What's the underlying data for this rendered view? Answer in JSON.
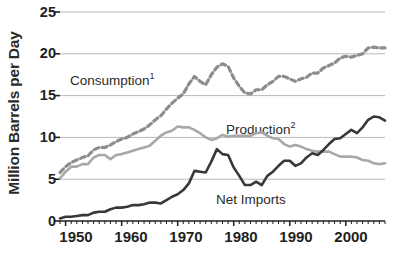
{
  "axes": {
    "y_title": "Million Barrels per Day",
    "y_ticks": [
      "25",
      "20",
      "15",
      "10",
      "5",
      "0"
    ],
    "x_ticks": [
      "1950",
      "1960",
      "1970",
      "1980",
      "1990",
      "2000"
    ]
  },
  "labels": {
    "consumption": "Consumption",
    "consumption_sup": "1",
    "production": "Production",
    "production_sup": "2",
    "net_imports": "Net Imports"
  },
  "colors": {
    "consumption": "#8d8d8d",
    "production": "#a8a8a8",
    "net_imports": "#383838",
    "grid": "#b9b9b9",
    "axis": "#1f1f1f",
    "text": "#1f1f1f"
  },
  "chart_data": {
    "type": "line",
    "title": "",
    "xlabel": "",
    "ylabel": "Million Barrels per Day",
    "xlim": [
      1949,
      2007
    ],
    "ylim": [
      0,
      25
    ],
    "grid": true,
    "legend": "inline-annotations",
    "x": [
      1949,
      1950,
      1951,
      1952,
      1953,
      1954,
      1955,
      1956,
      1957,
      1958,
      1959,
      1960,
      1961,
      1962,
      1963,
      1964,
      1965,
      1966,
      1967,
      1968,
      1969,
      1970,
      1971,
      1972,
      1973,
      1974,
      1975,
      1976,
      1977,
      1978,
      1979,
      1980,
      1981,
      1982,
      1983,
      1984,
      1985,
      1986,
      1987,
      1988,
      1989,
      1990,
      1991,
      1992,
      1993,
      1994,
      1995,
      1996,
      1997,
      1998,
      1999,
      2000,
      2001,
      2002,
      2003,
      2004,
      2005,
      2006,
      2007
    ],
    "series": [
      {
        "name": "Consumption",
        "style": "dashed",
        "color": "#8d8d8d",
        "values": [
          5.8,
          6.5,
          7.0,
          7.3,
          7.6,
          7.8,
          8.5,
          8.8,
          8.8,
          9.1,
          9.5,
          9.8,
          10.0,
          10.4,
          10.7,
          11.0,
          11.5,
          12.1,
          12.6,
          13.4,
          14.1,
          14.7,
          15.2,
          16.4,
          17.3,
          16.7,
          16.3,
          17.5,
          18.4,
          18.8,
          18.5,
          17.1,
          16.1,
          15.3,
          15.2,
          15.7,
          15.7,
          16.3,
          16.7,
          17.3,
          17.3,
          17.0,
          16.7,
          17.0,
          17.2,
          17.7,
          17.7,
          18.3,
          18.6,
          18.9,
          19.5,
          19.7,
          19.6,
          19.8,
          20.0,
          20.7,
          20.8,
          20.7,
          20.7
        ]
      },
      {
        "name": "Production",
        "style": "solid",
        "color": "#a8a8a8",
        "values": [
          5.1,
          5.9,
          6.5,
          6.5,
          6.8,
          6.8,
          7.6,
          7.9,
          7.9,
          7.4,
          7.9,
          8.0,
          8.2,
          8.4,
          8.6,
          8.8,
          9.0,
          9.6,
          10.2,
          10.6,
          10.8,
          11.3,
          11.2,
          11.2,
          10.9,
          10.5,
          10.0,
          9.7,
          9.9,
          10.3,
          10.1,
          10.2,
          10.2,
          10.2,
          10.2,
          10.5,
          10.6,
          10.2,
          9.9,
          9.8,
          9.2,
          8.9,
          9.1,
          8.9,
          8.6,
          8.4,
          8.3,
          8.3,
          8.3,
          8.0,
          7.7,
          7.7,
          7.7,
          7.6,
          7.3,
          7.2,
          6.9,
          6.8,
          6.9
        ]
      },
      {
        "name": "Net Imports",
        "style": "solid",
        "color": "#383838",
        "values": [
          0.3,
          0.5,
          0.5,
          0.6,
          0.7,
          0.7,
          1.0,
          1.1,
          1.1,
          1.4,
          1.6,
          1.6,
          1.7,
          1.9,
          1.9,
          2.0,
          2.2,
          2.2,
          2.1,
          2.5,
          2.9,
          3.2,
          3.7,
          4.5,
          6.0,
          5.9,
          5.8,
          7.1,
          8.6,
          8.0,
          7.9,
          6.4,
          5.4,
          4.3,
          4.3,
          4.7,
          4.3,
          5.4,
          5.9,
          6.6,
          7.2,
          7.2,
          6.6,
          6.9,
          7.6,
          8.1,
          7.9,
          8.5,
          9.2,
          9.8,
          9.9,
          10.4,
          10.9,
          10.5,
          11.2,
          12.1,
          12.5,
          12.4,
          12.0
        ]
      }
    ]
  }
}
